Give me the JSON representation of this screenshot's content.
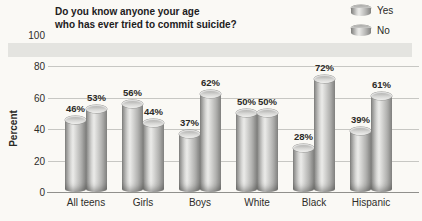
{
  "title": {
    "line1": "Do you know anyone your age",
    "line2": "who has ever tried to commit suicide?"
  },
  "legend": [
    {
      "label": "Yes"
    },
    {
      "label": "No"
    }
  ],
  "y_axis": {
    "label": "Percent",
    "ticks": [
      0,
      20,
      40,
      60,
      80,
      100
    ]
  },
  "chart_data": {
    "type": "bar",
    "title": "Do you know anyone your age who has ever tried to commit suicide?",
    "categories": [
      "All teens",
      "Girls",
      "Boys",
      "White",
      "Black",
      "Hispanic"
    ],
    "series": [
      {
        "name": "Yes",
        "values": [
          46,
          56,
          37,
          50,
          28,
          39
        ]
      },
      {
        "name": "No",
        "values": [
          53,
          44,
          62,
          50,
          72,
          61
        ]
      }
    ],
    "xlabel": "",
    "ylabel": "Percent",
    "ylim": [
      0,
      100
    ],
    "value_label_format": "{v}%",
    "grid": true,
    "legend_position": "top-right"
  },
  "colors": {
    "background": "#faf9f5",
    "band": "#e4e4e0",
    "grid": "#c7c7c3",
    "bar_gray": "#b5b5b3",
    "text": "#21201c"
  }
}
